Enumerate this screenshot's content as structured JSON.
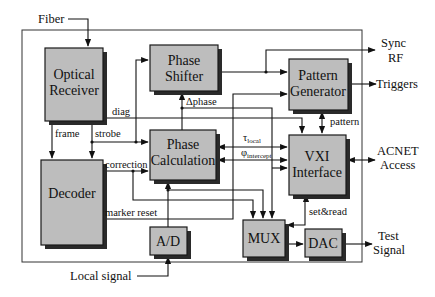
{
  "diagram": {
    "blocks": {
      "optical_receiver": [
        "Optical",
        "Receiver"
      ],
      "phase_shifter": [
        "Phase",
        "Shifter"
      ],
      "pattern_generator": [
        "Pattern",
        "Generator"
      ],
      "phase_calculation": [
        "Phase",
        "Calculation"
      ],
      "vxi_interface": [
        "VXI",
        "Interface"
      ],
      "decoder": [
        "Decoder"
      ],
      "ad": [
        "A/D"
      ],
      "mux": [
        "MUX"
      ],
      "dac": [
        "DAC"
      ]
    },
    "signals": {
      "diag": "diag",
      "frame": "frame",
      "strobe": "strobe",
      "delta_phase": "Δphase",
      "tau_main": "τ",
      "tau_sub": "local",
      "phi_main": "φ",
      "phi_sub": "intercept",
      "correction": "correction",
      "marker_reset": "marker reset",
      "pattern": "pattern",
      "set_read": "set&read"
    },
    "external": {
      "fiber": "Fiber",
      "sync_rf": [
        "Sync",
        "RF"
      ],
      "triggers": "Triggers",
      "acnet": [
        "ACNET",
        "Access"
      ],
      "test_signal": [
        "Test",
        "Signal"
      ],
      "local_signal": "Local signal"
    }
  }
}
